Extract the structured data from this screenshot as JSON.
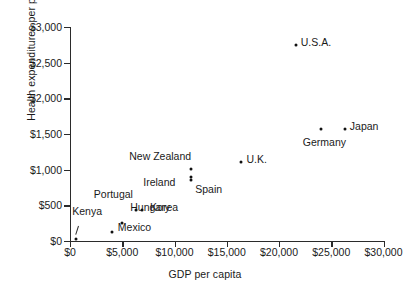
{
  "chart_data": {
    "type": "scatter",
    "title": "",
    "xlabel": "GDP per capita",
    "ylabel": "Health expenditures per person",
    "xlim": [
      0,
      30000
    ],
    "ylim": [
      0,
      3000
    ],
    "grid": false,
    "legend": "none",
    "xticks": [
      "$0",
      "$5,000",
      "$10,000",
      "$15,000",
      "$20,000",
      "$25,000",
      "$30,000"
    ],
    "xtick_values": [
      0,
      5000,
      10000,
      15000,
      20000,
      25000,
      30000
    ],
    "yticks": [
      "$0",
      "$500",
      "$1,000",
      "$1,500",
      "$2,000",
      "$2,500",
      "$3,000"
    ],
    "ytick_values": [
      0,
      500,
      1000,
      1500,
      2000,
      2500,
      3000
    ],
    "points": [
      {
        "name": "Kenya",
        "x": 600,
        "y": 30,
        "label_dx": -4,
        "label_dy": -28
      },
      {
        "name": "Mexico",
        "x": 4000,
        "y": 130,
        "label_dx": 6,
        "label_dy": -5
      },
      {
        "name": "Hungary",
        "x": 5000,
        "y": 250,
        "label_dx": 8,
        "label_dy": -16
      },
      {
        "name": "Portugal",
        "x": 6300,
        "y": 430,
        "label_dx": -42,
        "label_dy": -16
      },
      {
        "name": "Korea",
        "x": 6900,
        "y": 430,
        "label_dx": 8,
        "label_dy": -3
      },
      {
        "name": "Ireland",
        "x": 11600,
        "y": 850,
        "label_dx": -48,
        "label_dy": 2
      },
      {
        "name": "Spain",
        "x": 11600,
        "y": 900,
        "label_dx": 4,
        "label_dy": 12
      },
      {
        "name": "New Zealand",
        "x": 11600,
        "y": 1010,
        "label_dx": -62,
        "label_dy": -13
      },
      {
        "name": "U.K.",
        "x": 16400,
        "y": 1110,
        "label_dx": 5,
        "label_dy": -3
      },
      {
        "name": "Germany",
        "x": 24000,
        "y": 1570,
        "label_dx": -18,
        "label_dy": 13
      },
      {
        "name": "Japan",
        "x": 26300,
        "y": 1570,
        "label_dx": 5,
        "label_dy": -3
      },
      {
        "name": "U.S.A.",
        "x": 21600,
        "y": 2750,
        "label_dx": 5,
        "label_dy": -3
      }
    ]
  }
}
